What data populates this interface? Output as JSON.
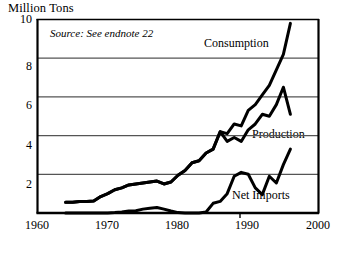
{
  "axis_title": "Million Tons",
  "source_note": "Source: See endnote 22",
  "labels": {
    "consumption": "Consumption",
    "production": "Production",
    "net_imports": "Net Imports"
  },
  "yticks": [
    "10",
    "8",
    "6",
    "4",
    "2"
  ],
  "xticks": [
    "1960",
    "1970",
    "1980",
    "1990",
    "2000"
  ],
  "colors": {
    "line": "#000000",
    "grid": "#555555",
    "axis": "#000000",
    "background": "#ffffff"
  },
  "chart_data": {
    "type": "line",
    "title": "Million Tons",
    "xlabel": "",
    "ylabel": "Million Tons",
    "xlim": [
      1960,
      2000
    ],
    "ylim": [
      0,
      10
    ],
    "yticks": [
      0,
      2,
      4,
      6,
      8,
      10
    ],
    "xticks": [
      1960,
      1970,
      1980,
      1990,
      2000
    ],
    "grid": true,
    "legend": "inline-annotations",
    "annotations": [
      "Consumption",
      "Production",
      "Net Imports",
      "Source: See endnote 22"
    ],
    "series": [
      {
        "name": "Consumption",
        "x": [
          1964,
          1965,
          1966,
          1967,
          1968,
          1969,
          1970,
          1971,
          1972,
          1973,
          1974,
          1975,
          1976,
          1977,
          1978,
          1979,
          1980,
          1981,
          1982,
          1983,
          1984,
          1985,
          1986,
          1987,
          1988,
          1989,
          1990,
          1991,
          1992,
          1993,
          1994,
          1995,
          1996
        ],
        "values": [
          0.55,
          0.55,
          0.6,
          0.6,
          0.62,
          0.85,
          1.0,
          1.2,
          1.3,
          1.45,
          1.5,
          1.55,
          1.6,
          1.65,
          1.5,
          1.6,
          1.95,
          2.2,
          2.6,
          2.7,
          3.1,
          3.3,
          4.2,
          4.1,
          4.6,
          4.5,
          5.3,
          5.6,
          6.1,
          6.6,
          7.4,
          8.2,
          9.8
        ]
      },
      {
        "name": "Production",
        "x": [
          1964,
          1965,
          1966,
          1967,
          1968,
          1969,
          1970,
          1971,
          1972,
          1973,
          1974,
          1975,
          1976,
          1977,
          1978,
          1979,
          1980,
          1981,
          1982,
          1983,
          1984,
          1985,
          1986,
          1987,
          1988,
          1989,
          1990,
          1991,
          1992,
          1993,
          1994,
          1995,
          1996
        ],
        "values": [
          0.55,
          0.55,
          0.6,
          0.6,
          0.62,
          0.85,
          1.0,
          1.2,
          1.3,
          1.45,
          1.5,
          1.55,
          1.6,
          1.65,
          1.5,
          1.6,
          1.95,
          2.2,
          2.6,
          2.7,
          3.1,
          3.3,
          4.2,
          3.7,
          3.9,
          3.7,
          4.3,
          4.6,
          5.1,
          5.0,
          5.6,
          6.5,
          5.1
        ]
      },
      {
        "name": "Net Imports",
        "x": [
          1964,
          1965,
          1966,
          1967,
          1968,
          1969,
          1970,
          1971,
          1972,
          1973,
          1974,
          1975,
          1976,
          1977,
          1978,
          1979,
          1980,
          1981,
          1982,
          1983,
          1984,
          1985,
          1986,
          1987,
          1988,
          1989,
          1990,
          1991,
          1992,
          1993,
          1994,
          1995,
          1996
        ],
        "values": [
          0.0,
          0.0,
          0.0,
          0.0,
          0.0,
          0.0,
          0.0,
          0.02,
          0.05,
          0.1,
          0.12,
          0.2,
          0.25,
          0.28,
          0.2,
          0.1,
          0.02,
          0.0,
          0.0,
          0.0,
          0.05,
          0.5,
          0.6,
          1.0,
          1.9,
          2.1,
          2.0,
          1.3,
          0.95,
          1.9,
          1.55,
          2.5,
          3.3
        ]
      }
    ]
  }
}
